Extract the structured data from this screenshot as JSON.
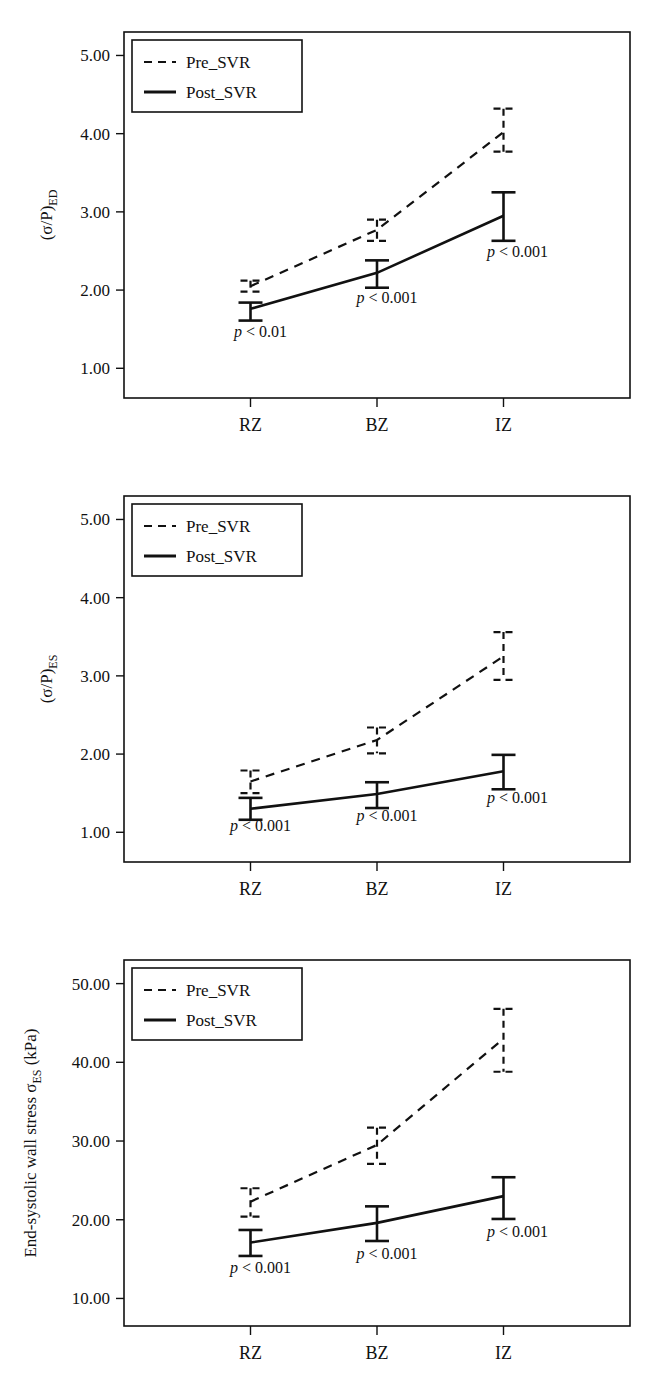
{
  "figure": {
    "legend": {
      "pre_label": "Pre_SVR",
      "post_label": "Post_SVR"
    },
    "categories": [
      "RZ",
      "BZ",
      "IZ"
    ]
  },
  "panels": [
    {
      "id": "panel-ed",
      "ylabel_main": "(σ/P)",
      "ylabel_sub": "ED",
      "yticks": [
        "1.00",
        "2.00",
        "3.00",
        "4.00",
        "5.00"
      ],
      "pvalues": [
        "p < 0.01",
        "p < 0.001",
        "p < 0.001"
      ]
    },
    {
      "id": "panel-es",
      "ylabel_main": "(σ/P)",
      "ylabel_sub": "ES",
      "yticks": [
        "1.00",
        "2.00",
        "3.00",
        "4.00",
        "5.00"
      ],
      "pvalues": [
        "p < 0.001",
        "p < 0.001",
        "p < 0.001"
      ]
    },
    {
      "id": "panel-wallstress",
      "ylabel_main": "End-systolic wall stress σ",
      "ylabel_sub": "ES",
      "ylabel_tail": " (kPa)",
      "yticks": [
        "10.00",
        "20.00",
        "30.00",
        "40.00",
        "50.00"
      ],
      "pvalues": [
        "p < 0.001",
        "p < 0.001",
        "p < 0.001"
      ]
    }
  ],
  "chart_data": [
    {
      "type": "line",
      "title": "",
      "xlabel": "",
      "ylabel": "(σ/P)ED",
      "categories": [
        "RZ",
        "BZ",
        "IZ"
      ],
      "ylim": [
        0.62,
        5.3
      ],
      "yticks": [
        1.0,
        2.0,
        3.0,
        4.0,
        5.0
      ],
      "grid": false,
      "legend_position": "top-left",
      "series": [
        {
          "name": "Pre_SVR",
          "style": "dashed",
          "values": [
            2.05,
            2.77,
            4.02
          ],
          "err_upper": [
            2.12,
            2.9,
            4.32
          ],
          "err_lower": [
            1.98,
            2.63,
            3.77
          ]
        },
        {
          "name": "Post_SVR",
          "style": "solid",
          "values": [
            1.76,
            2.22,
            2.95
          ],
          "err_upper": [
            1.84,
            2.38,
            3.25
          ],
          "err_lower": [
            1.61,
            2.03,
            2.63
          ]
        }
      ],
      "annotations": [
        {
          "text": "p < 0.01",
          "x": "RZ",
          "y": 1.4
        },
        {
          "text": "p < 0.001",
          "x": "BZ",
          "y": 1.84
        },
        {
          "text": "p < 0.001",
          "x": "IZ",
          "y": 2.42
        }
      ]
    },
    {
      "type": "line",
      "title": "",
      "xlabel": "",
      "ylabel": "(σ/P)ES",
      "categories": [
        "RZ",
        "BZ",
        "IZ"
      ],
      "ylim": [
        0.62,
        5.3
      ],
      "yticks": [
        1.0,
        2.0,
        3.0,
        4.0,
        5.0
      ],
      "grid": false,
      "legend_position": "top-left",
      "series": [
        {
          "name": "Pre_SVR",
          "style": "dashed",
          "values": [
            1.65,
            2.18,
            3.25
          ],
          "err_upper": [
            1.79,
            2.34,
            3.56
          ],
          "err_lower": [
            1.5,
            2.01,
            2.95
          ]
        },
        {
          "name": "Post_SVR",
          "style": "solid",
          "values": [
            1.3,
            1.49,
            1.78
          ],
          "err_upper": [
            1.44,
            1.64,
            1.99
          ],
          "err_lower": [
            1.16,
            1.31,
            1.55
          ]
        }
      ],
      "annotations": [
        {
          "text": "p < 0.001",
          "x": "RZ",
          "y": 1.02
        },
        {
          "text": "p < 0.001",
          "x": "BZ",
          "y": 1.15
        },
        {
          "text": "p < 0.001",
          "x": "IZ",
          "y": 1.37
        }
      ]
    },
    {
      "type": "line",
      "title": "",
      "xlabel": "",
      "ylabel": "End-systolic wall stress σES (kPa)",
      "categories": [
        "RZ",
        "BZ",
        "IZ"
      ],
      "ylim": [
        6.5,
        53.0
      ],
      "yticks": [
        10.0,
        20.0,
        30.0,
        40.0,
        50.0
      ],
      "grid": false,
      "legend_position": "top-left",
      "series": [
        {
          "name": "Pre_SVR",
          "style": "dashed",
          "values": [
            22.3,
            29.5,
            43.0
          ],
          "err_upper": [
            24.0,
            31.7,
            46.8
          ],
          "err_lower": [
            20.4,
            27.1,
            38.8
          ]
        },
        {
          "name": "Post_SVR",
          "style": "solid",
          "values": [
            17.1,
            19.6,
            23.0
          ],
          "err_upper": [
            18.7,
            21.7,
            25.4
          ],
          "err_lower": [
            15.4,
            17.3,
            20.1
          ]
        }
      ],
      "annotations": [
        {
          "text": "p < 0.001",
          "x": "RZ",
          "y": 13.2
        },
        {
          "text": "p < 0.001",
          "x": "BZ",
          "y": 15.0
        },
        {
          "text": "p < 0.001",
          "x": "IZ",
          "y": 17.8
        }
      ]
    }
  ]
}
